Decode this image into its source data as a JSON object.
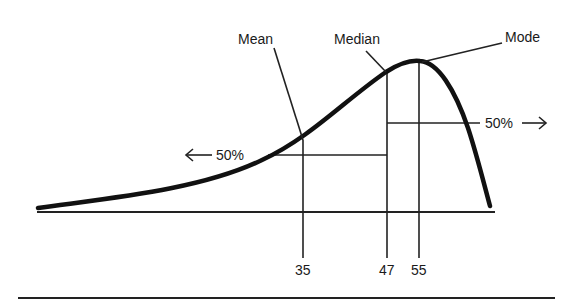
{
  "diagram": {
    "type": "skewed-distribution",
    "labels": {
      "mean": "Mean",
      "median": "Median",
      "mode": "Mode"
    },
    "percent_left": "50%",
    "percent_right": "50%",
    "ticks": {
      "mean_value": "35",
      "median_value": "47",
      "mode_value": "55"
    },
    "colors": {
      "line": "#111111",
      "background": "#ffffff"
    }
  }
}
